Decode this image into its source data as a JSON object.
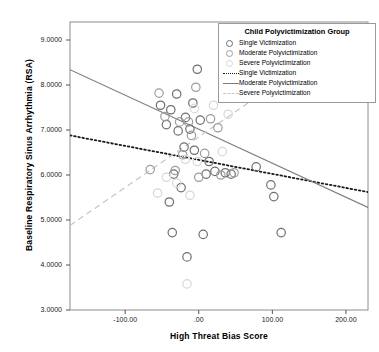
{
  "chart_data": {
    "type": "scatter",
    "title": "",
    "xlabel": "High Threat Bias Score",
    "ylabel": "Baseline Respiratory Sinus Arrhythmia (RSA)",
    "xlim": [
      -175,
      230
    ],
    "ylim": [
      3.0,
      9.4
    ],
    "xticks": [
      "-100.00",
      ".00",
      "100.00",
      "200.00"
    ],
    "xtick_values": [
      -100,
      0,
      100,
      200
    ],
    "yticks": [
      "3.0000",
      "4.0000",
      "5.0000",
      "6.0000",
      "7.0000",
      "8.0000",
      "9.0000"
    ],
    "ytick_values": [
      3,
      4,
      5,
      6,
      7,
      8,
      9
    ],
    "grid": false,
    "legend_position": "top-right",
    "legend_title": "Child Polyvictimization Group",
    "marker_colors": {
      "single": "#6f6f6f",
      "moderate": "#9d9d9d",
      "severe": "#d8d8d8"
    },
    "line_colors": {
      "single": "#1a1a1a",
      "moderate": "#7d7d7d",
      "severe": "#c6c6c6"
    },
    "series": [
      {
        "name": "Single Victimization",
        "marker": "open-circle",
        "color": "#6f6f6f",
        "points": [
          [
            -2,
            8.35
          ],
          [
            -38,
            7.45
          ],
          [
            -30,
            7.8
          ],
          [
            -18,
            7.28
          ],
          [
            -52,
            7.55
          ],
          [
            -44,
            7.12
          ],
          [
            -28,
            6.98
          ],
          [
            -8,
            7.6
          ],
          [
            -12,
            7.02
          ],
          [
            2,
            7.22
          ],
          [
            -20,
            6.62
          ],
          [
            -6,
            6.55
          ],
          [
            14,
            6.3
          ],
          [
            22,
            6.08
          ],
          [
            -34,
            6.02
          ],
          [
            -24,
            5.72
          ],
          [
            -40,
            5.4
          ],
          [
            10,
            6.02
          ],
          [
            36,
            6.05
          ],
          [
            44,
            6.02
          ],
          [
            78,
            6.18
          ],
          [
            -36,
            4.72
          ],
          [
            6,
            4.68
          ],
          [
            -16,
            4.18
          ],
          [
            102,
            5.52
          ],
          [
            98,
            5.78
          ],
          [
            112,
            4.72
          ]
        ]
      },
      {
        "name": "Moderate Polyvictimization",
        "marker": "open-circle",
        "color": "#9d9d9d",
        "points": [
          [
            -54,
            7.82
          ],
          [
            -46,
            7.3
          ],
          [
            -26,
            7.18
          ],
          [
            -14,
            7.18
          ],
          [
            -4,
            7.95
          ],
          [
            16,
            7.25
          ],
          [
            -10,
            6.88
          ],
          [
            8,
            6.48
          ],
          [
            -22,
            6.45
          ],
          [
            26,
            7.05
          ],
          [
            -32,
            6.1
          ],
          [
            0,
            5.95
          ],
          [
            30,
            6.0
          ],
          [
            48,
            6.05
          ],
          [
            -66,
            6.12
          ]
        ]
      },
      {
        "name": "Severe Polyvictimization",
        "marker": "open-circle",
        "color": "#d8d8d8",
        "points": [
          [
            -6,
            7.48
          ],
          [
            20,
            7.55
          ],
          [
            32,
            6.52
          ],
          [
            -18,
            6.35
          ],
          [
            -2,
            6.3
          ],
          [
            -30,
            5.82
          ],
          [
            -44,
            5.95
          ],
          [
            -12,
            5.55
          ],
          [
            -16,
            3.58
          ],
          [
            40,
            7.35
          ],
          [
            -56,
            5.6
          ]
        ]
      }
    ],
    "regression_lines": [
      {
        "name": "Single Victimization",
        "style": "dotted",
        "color": "#1a1a1a",
        "x1": -175,
        "y1": 6.88,
        "x2": 230,
        "y2": 5.62
      },
      {
        "name": "Moderate Polyvictimization",
        "style": "solid",
        "color": "#7d7d7d",
        "x1": -175,
        "y1": 8.34,
        "x2": 230,
        "y2": 5.28
      },
      {
        "name": "Severe Polyvictimization",
        "style": "dashed",
        "color": "#c6c6c6",
        "x1": -175,
        "y1": 4.88,
        "x2": 140,
        "y2": 8.42
      }
    ]
  },
  "legend": {
    "title": "Child Polyvictimization Group",
    "entries": [
      {
        "label": "Single Victimization",
        "key": "marker"
      },
      {
        "label": "Moderate Polyvictimization",
        "key": "marker"
      },
      {
        "label": "Severe Polyvictimization",
        "key": "marker"
      },
      {
        "label": "Single Victimization",
        "key": "line"
      },
      {
        "label": "Moderate Polyvictimization",
        "key": "line"
      },
      {
        "label": "Severe Polyvictimization",
        "key": "line"
      }
    ]
  }
}
